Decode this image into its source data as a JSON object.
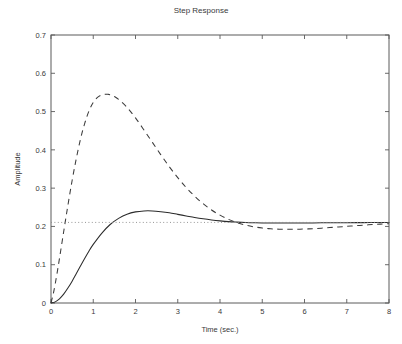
{
  "chart_data": {
    "type": "line",
    "title": "Step Response",
    "xlabel": "Time (sec.)",
    "ylabel": "Amplitude",
    "xlim": [
      0,
      8
    ],
    "ylim": [
      0,
      0.7
    ],
    "xticks": [
      "0",
      "1",
      "2",
      "3",
      "4",
      "5",
      "6",
      "7",
      "8"
    ],
    "xtick_values": [
      0,
      1,
      2,
      3,
      4,
      5,
      6,
      7,
      8
    ],
    "yticks": [
      "0",
      "0.1",
      "0.2",
      "0.3",
      "0.4",
      "0.5",
      "0.6",
      "0.7"
    ],
    "ytick_values": [
      0,
      0.1,
      0.2,
      0.3,
      0.4,
      0.5,
      0.6,
      0.7
    ],
    "grid": false,
    "legend": "none",
    "colors": {
      "solid_curve": "#2b2b2b",
      "dashed_curve": "#3b3b3b",
      "dotted_reference": "#8a8a8a",
      "axis": "#5a5a5a",
      "text": "#3a3a3a",
      "background": "#ffffff"
    },
    "series": [
      {
        "name": "compensated-response",
        "style": "solid",
        "x": [
          0,
          0.1,
          0.2,
          0.3,
          0.4,
          0.5,
          0.6,
          0.7,
          0.8,
          0.9,
          1.0,
          1.2,
          1.4,
          1.6,
          1.8,
          2.0,
          2.2,
          2.4,
          2.6,
          2.8,
          3.0,
          3.2,
          3.4,
          3.6,
          3.8,
          4.0,
          4.2,
          4.4,
          4.6,
          4.8,
          5.0,
          5.4,
          5.8,
          6.2,
          6.6,
          7.0,
          7.4,
          7.8,
          8.0
        ],
        "y": [
          0.0,
          0.003,
          0.011,
          0.023,
          0.039,
          0.057,
          0.077,
          0.097,
          0.117,
          0.136,
          0.153,
          0.182,
          0.205,
          0.221,
          0.232,
          0.238,
          0.2405,
          0.2405,
          0.2385,
          0.2355,
          0.2315,
          0.2275,
          0.2235,
          0.22,
          0.217,
          0.2145,
          0.2125,
          0.2112,
          0.2102,
          0.2095,
          0.209,
          0.2088,
          0.2089,
          0.2092,
          0.2095,
          0.2098,
          0.21,
          0.2102,
          0.2103
        ]
      },
      {
        "name": "uncompensated-response",
        "style": "dashed",
        "x": [
          0,
          0.05,
          0.1,
          0.15,
          0.2,
          0.3,
          0.4,
          0.5,
          0.6,
          0.7,
          0.8,
          0.9,
          1.0,
          1.1,
          1.2,
          1.3,
          1.35,
          1.4,
          1.5,
          1.6,
          1.8,
          2.0,
          2.2,
          2.4,
          2.6,
          2.8,
          3.0,
          3.2,
          3.4,
          3.6,
          3.8,
          4.0,
          4.2,
          4.4,
          4.6,
          4.8,
          5.0,
          5.2,
          5.4,
          5.6,
          5.8,
          6.0,
          6.2,
          6.4,
          6.6,
          6.8,
          7.0,
          7.2,
          7.4,
          7.6,
          7.8,
          8.0
        ],
        "y": [
          0.0,
          0.022,
          0.05,
          0.082,
          0.116,
          0.186,
          0.255,
          0.32,
          0.378,
          0.429,
          0.47,
          0.502,
          0.524,
          0.537,
          0.5435,
          0.5452,
          0.545,
          0.544,
          0.5395,
          0.532,
          0.511,
          0.4835,
          0.452,
          0.4195,
          0.387,
          0.356,
          0.3275,
          0.3015,
          0.279,
          0.2595,
          0.243,
          0.2295,
          0.2185,
          0.21,
          0.2035,
          0.199,
          0.1958,
          0.1938,
          0.1928,
          0.1924,
          0.1926,
          0.1932,
          0.1942,
          0.1955,
          0.197,
          0.1986,
          0.2002,
          0.2018,
          0.2034,
          0.2048,
          0.206,
          0.207
        ]
      },
      {
        "name": "steady-state-reference",
        "style": "dotted",
        "x": [
          0,
          8
        ],
        "y": [
          0.2105,
          0.2105
        ]
      }
    ]
  }
}
